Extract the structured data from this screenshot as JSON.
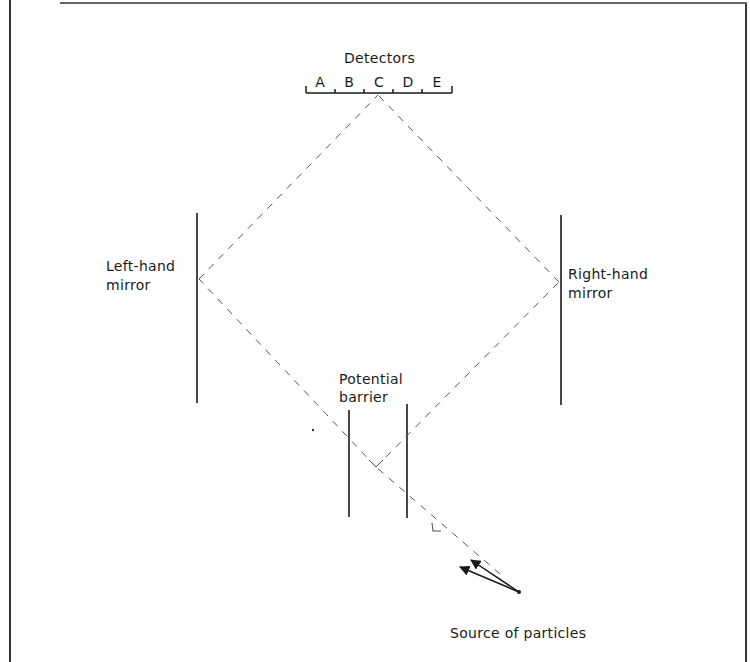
{
  "diagram": {
    "type": "interferometer",
    "labels": {
      "detectors": "Detectors",
      "left_mirror": "Left-hand\nmirror",
      "right_mirror": "Right-hand\nmirror",
      "barrier": "Potential\nbarrier",
      "source": "Source of particles"
    },
    "detector_slots": [
      "A",
      "B",
      "C",
      "D",
      "E"
    ],
    "colors": {
      "ink": "#1a1a1a",
      "beam": "#555555",
      "background": "#ffffff"
    },
    "geometry": {
      "detector_bar": {
        "x1": 306,
        "x2": 452,
        "y": 93
      },
      "detector_ticks_x": [
        306,
        335,
        364,
        393,
        422,
        452
      ],
      "detector_hit": {
        "x": 378,
        "y": 95
      },
      "left_mirror": {
        "x": 197,
        "y1": 213,
        "y2": 403
      },
      "left_reflect": {
        "x": 199,
        "y": 279
      },
      "right_mirror": {
        "x": 561,
        "y1": 215,
        "y2": 405
      },
      "right_reflect": {
        "x": 559,
        "y": 282
      },
      "barrier_left": {
        "x": 349,
        "y1": 410,
        "y2": 517
      },
      "barrier_right": {
        "x": 407,
        "y1": 404,
        "y2": 518
      },
      "split_point": {
        "x": 376,
        "y": 467
      },
      "source_point": {
        "x": 519,
        "y": 592
      }
    }
  }
}
